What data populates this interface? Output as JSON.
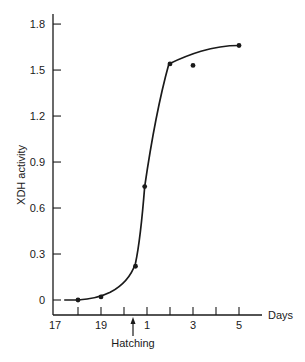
{
  "chart_data": {
    "type": "line",
    "title": "",
    "xlabel": "Days",
    "ylabel": "XDH activity",
    "x_tick_positions": [
      17,
      18,
      19,
      20,
      21,
      22,
      23,
      24,
      25
    ],
    "x_tick_labels": [
      "17",
      "",
      "19",
      "",
      "1",
      "",
      "3",
      "",
      "5"
    ],
    "y_ticks": [
      0,
      0.3,
      0.6,
      0.9,
      1.2,
      1.5,
      1.8
    ],
    "y_tick_labels": [
      "0",
      "0.3",
      "0.6",
      "0.9",
      "1.2",
      "1.5",
      "1.8"
    ],
    "ylim": [
      0,
      1.8
    ],
    "xlim": [
      17,
      25.5
    ],
    "grid": false,
    "legend": null,
    "annotations": [
      {
        "text": "Hatching",
        "x": 20.25,
        "type": "arrow-up-from-below-axis"
      }
    ],
    "series": [
      {
        "name": "XDH activity",
        "x_labels": [
          "18",
          "19",
          "20.5",
          "21 (day 1)",
          "22 (day 2)",
          "23 (day 3)",
          "25 (day 5)"
        ],
        "x": [
          18,
          19,
          20.5,
          20.9,
          22,
          23,
          25
        ],
        "y": [
          0.0,
          0.02,
          0.22,
          0.74,
          1.54,
          1.53,
          1.66
        ]
      }
    ],
    "fitted_curve_note": "Smooth sigmoid curve through points; day-3 point (1.53) lies below curve"
  },
  "labels": {
    "ylabel": "XDH activity",
    "xlabel": "Days",
    "annotation": "Hatching"
  }
}
